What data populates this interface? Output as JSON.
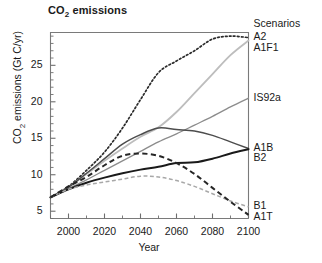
{
  "chart_data": {
    "type": "line",
    "title": "CO2 emissions",
    "title_rich": {
      "pre": "CO",
      "sub": "2",
      "post": " emissions"
    },
    "xlabel": "Year",
    "ylabel": "CO2 emissions (Gt C/yr)",
    "ylabel_rich": {
      "pre": "CO",
      "sub": "2",
      "post": " emissions (Gt C/yr)"
    },
    "xlim": [
      1990,
      2100
    ],
    "ylim": [
      4,
      29.5
    ],
    "grid": false,
    "legend_position": "right-outside",
    "legend_title": "Scenarios",
    "xticks": [
      2000,
      2020,
      2040,
      2060,
      2080,
      2100
    ],
    "xtick_labels": [
      "2000",
      "2020",
      "2040",
      "2060",
      "2080",
      "2100"
    ],
    "yticks": [
      5,
      10,
      15,
      20,
      25
    ],
    "ytick_labels": [
      "5",
      "10",
      "15",
      "20",
      "25"
    ],
    "x": [
      1990,
      2000,
      2010,
      2020,
      2030,
      2040,
      2050,
      2060,
      2070,
      2080,
      2090,
      2100
    ],
    "series": [
      {
        "name": "A2",
        "label": "A2",
        "style": "dotted",
        "color": "#2b2b2b",
        "width": 1.7,
        "values": [
          6.9,
          8.4,
          10.6,
          13.1,
          16.4,
          20.3,
          24.0,
          25.6,
          27.0,
          28.6,
          29.0,
          28.8
        ],
        "end_value": 28.8
      },
      {
        "name": "A1F1",
        "label": "A1F1",
        "style": "solid",
        "color": "#bdbdbd",
        "width": 1.8,
        "values": [
          6.9,
          8.3,
          10.1,
          11.9,
          13.6,
          15.2,
          16.5,
          18.6,
          21.2,
          23.8,
          26.4,
          28.4
        ],
        "end_value": 28.4
      },
      {
        "name": "IS92a",
        "label": "IS92a",
        "style": "solid",
        "color": "#8c8c8c",
        "width": 1.3,
        "values": [
          6.9,
          8.1,
          9.3,
          10.6,
          11.9,
          13.2,
          14.5,
          15.6,
          16.8,
          18.0,
          19.3,
          20.5
        ],
        "end_value": 20.5
      },
      {
        "name": "A1B",
        "label": "A1B",
        "style": "solid",
        "color": "#4d4d4d",
        "width": 1.5,
        "values": [
          6.9,
          8.3,
          10.2,
          12.2,
          14.2,
          15.5,
          16.4,
          16.2,
          16.0,
          15.4,
          14.5,
          13.6
        ],
        "end_value": 13.6
      },
      {
        "name": "B2",
        "label": "B2",
        "style": "solid",
        "color": "#1a1a1a",
        "width": 2.0,
        "values": [
          6.9,
          8.0,
          8.9,
          9.6,
          10.2,
          10.7,
          11.1,
          11.6,
          11.7,
          12.2,
          12.9,
          13.5
        ],
        "end_value": 13.5
      },
      {
        "name": "B1",
        "label": "B1",
        "style": "dashed",
        "color": "#a8a8a8",
        "width": 1.5,
        "values": [
          6.9,
          8.0,
          8.6,
          9.0,
          9.4,
          9.8,
          9.7,
          9.2,
          8.4,
          7.4,
          6.4,
          5.6
        ],
        "end_value": 5.6
      },
      {
        "name": "A1T",
        "label": "A1T",
        "style": "dashed",
        "color": "#262626",
        "width": 2.0,
        "values": [
          6.9,
          8.4,
          9.7,
          11.3,
          12.6,
          12.9,
          12.6,
          11.6,
          10.1,
          8.2,
          6.3,
          4.5
        ],
        "end_value": 4.5
      }
    ]
  }
}
